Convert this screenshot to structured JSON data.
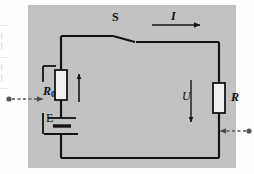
{
  "figure": {
    "type": "circuit-diagram",
    "panel_color": "#c2c2c2",
    "wire_color": "#141414",
    "background_color": "#fefefe"
  },
  "labels": {
    "switch": "S",
    "current": "I",
    "internal_resistor": "R",
    "internal_resistor_sub": "0",
    "emf": "E",
    "voltage": "U",
    "load_resistor": "R"
  },
  "components": {
    "switch_state": "open",
    "current_arrow_direction": "right",
    "voltage_arrow_direction": "down",
    "branch_arrow_direction": "up"
  },
  "annotations": {
    "left_pointer_direction": "right",
    "right_pointer_direction": "left",
    "pointer_style": "dashed"
  },
  "margin_text": {
    "lines": [
      "一",
      "丨",
      "丨",
      "一",
      "I",
      "丨",
      "一"
    ]
  }
}
